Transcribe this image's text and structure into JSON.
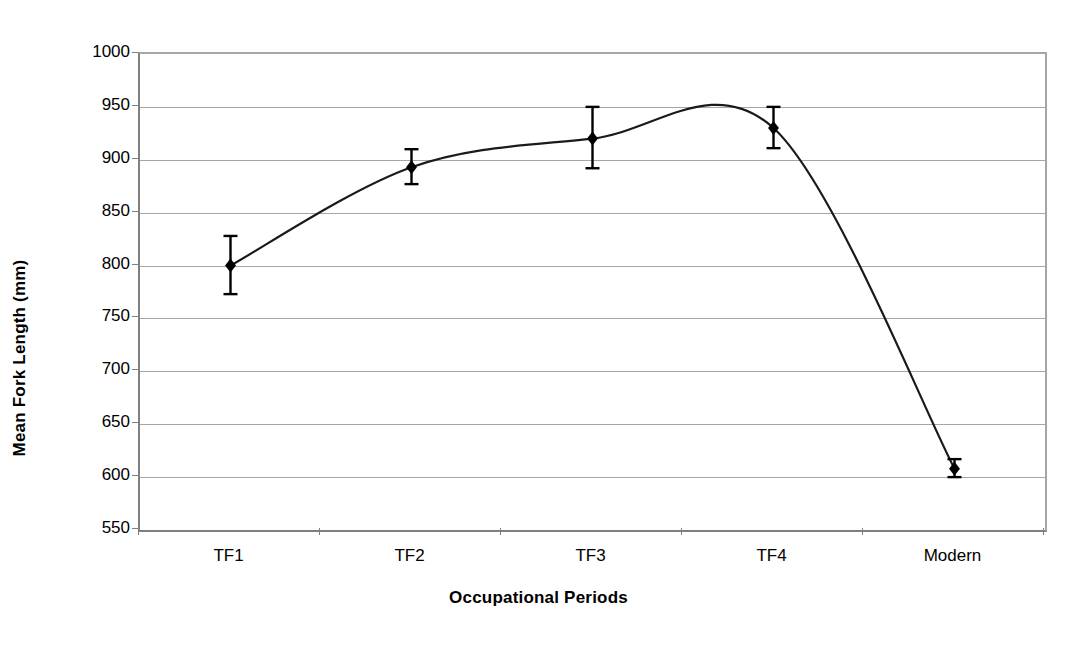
{
  "chart_data": {
    "type": "line",
    "title": "",
    "xlabel": "Occupational Periods",
    "ylabel": "Mean Fork Length (mm)",
    "categories": [
      "TF1",
      "TF2",
      "TF3",
      "TF4",
      "Modern"
    ],
    "values": [
      800,
      893,
      920,
      930,
      608
    ],
    "error_low": [
      773,
      877,
      892,
      911,
      600
    ],
    "error_high": [
      828,
      910,
      950,
      950,
      617
    ],
    "ylim": [
      550,
      1000
    ],
    "yticks": [
      550,
      600,
      650,
      700,
      750,
      800,
      850,
      900,
      950,
      1000
    ],
    "ytick_labels": [
      "550",
      "600",
      "650",
      "700",
      "750",
      "800",
      "850",
      "900",
      "950",
      "1000"
    ],
    "grid": true,
    "legend": "none",
    "smoothed_line": true,
    "curve_peak_value": 952,
    "marker": "diamond",
    "series": [
      {
        "name": "Mean Fork Length",
        "values": [
          800,
          893,
          920,
          930,
          608
        ]
      }
    ]
  },
  "style": {
    "line_color": "#1a1a1a",
    "marker_color": "#000000",
    "grid_color": "#a6a6a6",
    "axis_color": "#808080",
    "background": "#ffffff"
  }
}
